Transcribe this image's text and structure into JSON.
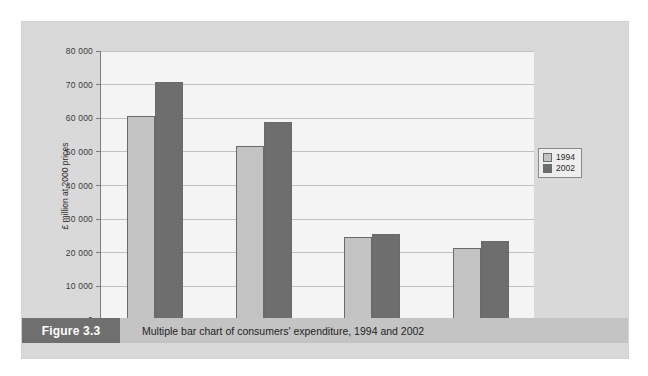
{
  "figure": {
    "tag": "Figure 3.3",
    "caption": "Multiple bar chart of consumers' expenditure, 1994 and 2002"
  },
  "colors": {
    "series_1994": "#c3c3c3",
    "series_2002": "#6e6e6e",
    "panel_background": "#d9d9d9",
    "plot_background": "#f4f4f4",
    "gridline": "#c0c0c0",
    "axis": "#7d7d7d",
    "caption_bar": "#c4c4c4",
    "caption_tag": "#6f6f6f"
  },
  "legend": {
    "position": "right",
    "entries": [
      {
        "label": "1994",
        "color": "#c3c3c3"
      },
      {
        "label": "2002",
        "color": "#6e6e6e"
      }
    ]
  },
  "chart_data": {
    "type": "bar",
    "title": "",
    "subtitle": "",
    "xlabel": "",
    "ylabel": "£ million at 2000 prices",
    "categories": [
      "Restaurants and Hotels",
      "Food and Drink",
      "Alcohol and Tobacco",
      "Housing"
    ],
    "series": [
      {
        "name": "1994",
        "color": "#c3c3c3",
        "values": [
          60500,
          51500,
          24300,
          21200
        ]
      },
      {
        "name": "2002",
        "color": "#6e6e6e",
        "values": [
          70500,
          58500,
          25200,
          23200
        ]
      }
    ],
    "ylim": [
      0,
      80000
    ],
    "ytick_values": [
      0,
      10000,
      20000,
      30000,
      40000,
      50000,
      60000,
      70000,
      80000
    ],
    "ytick_labels": [
      "0",
      "10 000",
      "20 000",
      "30 000",
      "40 000",
      "50 000",
      "60 000",
      "70 000",
      "80 000"
    ],
    "grid": true,
    "grid_axis": "y",
    "legend_position": "right",
    "units": "£ million at 2000 prices"
  }
}
